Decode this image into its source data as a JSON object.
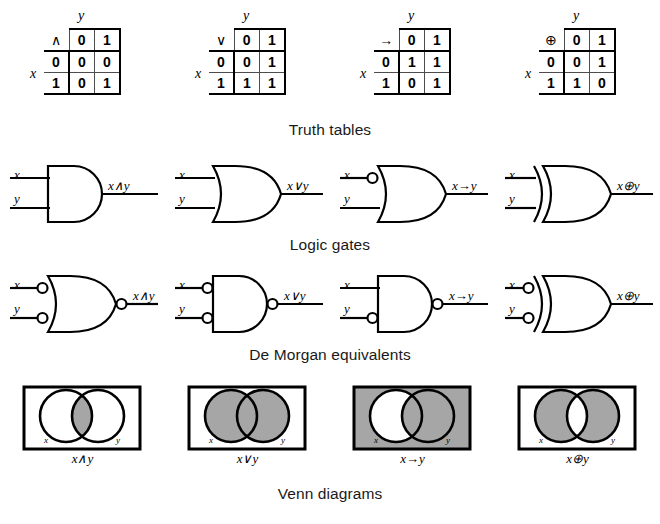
{
  "figure": {
    "sections": [
      {
        "caption": "Truth tables"
      },
      {
        "caption": "Logic gates"
      },
      {
        "caption": "De Morgan equivalents"
      },
      {
        "caption": "Venn diagrams"
      }
    ]
  },
  "truth_tables": {
    "row_var": "x",
    "col_var": "y",
    "col_headers": [
      "0",
      "1"
    ],
    "row_headers": [
      "0",
      "1"
    ],
    "tables": [
      {
        "operator": "∧",
        "name": "conjunction",
        "rows": [
          [
            "0",
            "0"
          ],
          [
            "0",
            "1"
          ]
        ]
      },
      {
        "operator": "∨",
        "name": "disjunction",
        "rows": [
          [
            "0",
            "1"
          ],
          [
            "1",
            "1"
          ]
        ]
      },
      {
        "operator": "→",
        "name": "implication",
        "rows": [
          [
            "1",
            "1"
          ],
          [
            "0",
            "1"
          ]
        ]
      },
      {
        "operator": "⊕",
        "name": "exclusive-or",
        "rows": [
          [
            "0",
            "1"
          ],
          [
            "1",
            "0"
          ]
        ]
      }
    ]
  },
  "gates": {
    "input_x": "x",
    "input_y": "y",
    "items": [
      {
        "name": "and-gate",
        "shape": "and",
        "output": "x∧y",
        "bubble_x": false,
        "bubble_y": false,
        "bubble_out": false
      },
      {
        "name": "or-gate",
        "shape": "or",
        "output": "x∨y",
        "bubble_x": false,
        "bubble_y": false,
        "bubble_out": false
      },
      {
        "name": "implication-gate",
        "shape": "or",
        "output": "x→y",
        "bubble_x": true,
        "bubble_y": false,
        "bubble_out": false
      },
      {
        "name": "xor-gate",
        "shape": "xor",
        "output": "x⊕y",
        "bubble_x": false,
        "bubble_y": false,
        "bubble_out": false
      }
    ]
  },
  "demorgan": {
    "input_x": "x",
    "input_y": "y",
    "items": [
      {
        "name": "demorgan-and",
        "shape": "or",
        "output": "x∧y",
        "bubble_x": true,
        "bubble_y": true,
        "bubble_out": true
      },
      {
        "name": "demorgan-or",
        "shape": "and",
        "output": "x∨y",
        "bubble_x": true,
        "bubble_y": true,
        "bubble_out": true
      },
      {
        "name": "demorgan-implication",
        "shape": "and",
        "output": "x→y",
        "bubble_x": false,
        "bubble_y": true,
        "bubble_out": true
      },
      {
        "name": "demorgan-xor",
        "shape": "xor",
        "output": "x⊕y",
        "bubble_x": true,
        "bubble_y": true,
        "bubble_out": false
      }
    ]
  },
  "venn": {
    "label_x": "x",
    "label_y": "y",
    "shade_color": "#a6a6a6",
    "items": [
      {
        "name": "venn-and",
        "label": "x∧y",
        "regions": {
          "universe": false,
          "x_only": false,
          "intersection": true,
          "y_only": false
        }
      },
      {
        "name": "venn-or",
        "label": "x∨y",
        "regions": {
          "universe": false,
          "x_only": true,
          "intersection": true,
          "y_only": true
        }
      },
      {
        "name": "venn-implication",
        "label": "x→y",
        "regions": {
          "universe": true,
          "x_only": false,
          "intersection": true,
          "y_only": true
        }
      },
      {
        "name": "venn-xor",
        "label": "x⊕y",
        "regions": {
          "universe": false,
          "x_only": true,
          "intersection": false,
          "y_only": true
        }
      }
    ]
  }
}
